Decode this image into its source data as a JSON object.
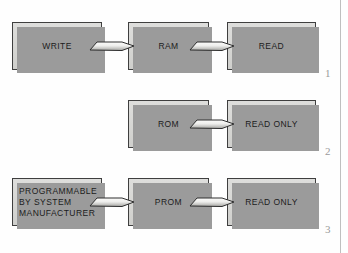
{
  "figure": {
    "rows": [
      {
        "number": "1",
        "boxes": [
          {
            "label": "WRITE"
          },
          {
            "label": "RAM"
          },
          {
            "label": "READ"
          }
        ],
        "arrows": [
          {
            "name": "arrow-write-to-ram"
          },
          {
            "name": "arrow-ram-to-read"
          }
        ]
      },
      {
        "number": "2",
        "boxes": [
          {
            "label": "ROM"
          },
          {
            "label": "READ ONLY"
          }
        ],
        "arrows": [
          {
            "name": "arrow-rom-to-read-only"
          }
        ]
      },
      {
        "number": "3",
        "boxes": [
          {
            "label": "PROGRAMMABLE\nBY SYSTEM\nMANUFACTURER"
          },
          {
            "label": "PROM"
          },
          {
            "label": "READ ONLY"
          }
        ],
        "arrows": [
          {
            "name": "arrow-programmable-to-prom"
          },
          {
            "name": "arrow-prom-to-read-only"
          }
        ]
      }
    ]
  },
  "colors": {
    "box_fill_top": "#dededc",
    "box_fill_bottom": "#cfcfcc",
    "box_border": "#3f3f3f",
    "box_shadow": "#9b9b9b",
    "arrow_fill_light": "#f4f4f2",
    "arrow_fill_dark": "#a9a9a6",
    "arrow_border": "#2e2e2e",
    "row_number": "#9a9a9a",
    "margin_rule": "#bfbfbf",
    "page_background": "#ffffff"
  }
}
